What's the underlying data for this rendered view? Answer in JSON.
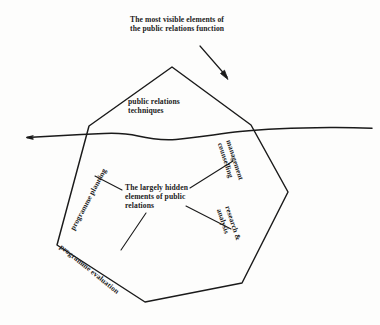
{
  "diagram": {
    "type": "iceberg-diagram",
    "title_caption": "The most visible elements of\nthe public relations function",
    "visible_section": {
      "label": "public relations\ntechniques"
    },
    "hidden_section": {
      "center_label": "The largely hidden\nelements of public\nrelations",
      "facets": [
        {
          "id": "programme-planning",
          "label": "programme planning"
        },
        {
          "id": "programme-evaluation",
          "label": "programme evaluation"
        },
        {
          "id": "management-counselling",
          "label": "management\ncounselling"
        },
        {
          "id": "research-analysis",
          "label": "research &\nanalysis"
        }
      ]
    },
    "waterline": {
      "name": "waterline"
    },
    "arrow": {
      "name": "caption-arrow"
    },
    "colors": {
      "ink": "#1a1a1a",
      "background": "#fdfdfc"
    }
  }
}
